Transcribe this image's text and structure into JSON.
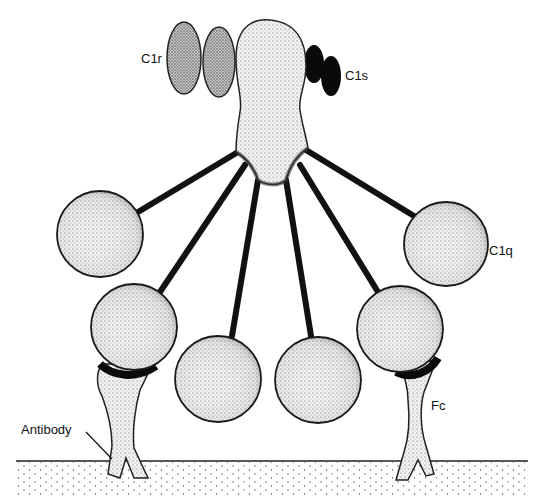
{
  "diagram": {
    "labels": {
      "c1r": "C1r",
      "c1s": "C1s",
      "c1q": "C1q",
      "fc": "Fc",
      "antibody": "Antibody"
    },
    "components": [
      {
        "id": "c1r",
        "shape": "two stippled ellipses",
        "position": "upper-left of core"
      },
      {
        "id": "c1s",
        "shape": "two solid black ellipses",
        "position": "upper-right of core"
      },
      {
        "id": "c1q-core",
        "shape": "stippled stalk body",
        "position": "top center"
      },
      {
        "id": "c1q-heads",
        "count": 6,
        "shape": "stippled globular heads on stalks"
      },
      {
        "id": "antibodies",
        "count": 2,
        "shape": "Y-shaped stippled molecules anchored in surface"
      },
      {
        "id": "surface",
        "shape": "horizontal line with dotted fill below"
      }
    ],
    "colors": {
      "ink": "#111111",
      "fill_light": "#ececec",
      "fill_mid": "#bdbdbd",
      "background": "#ffffff"
    }
  }
}
